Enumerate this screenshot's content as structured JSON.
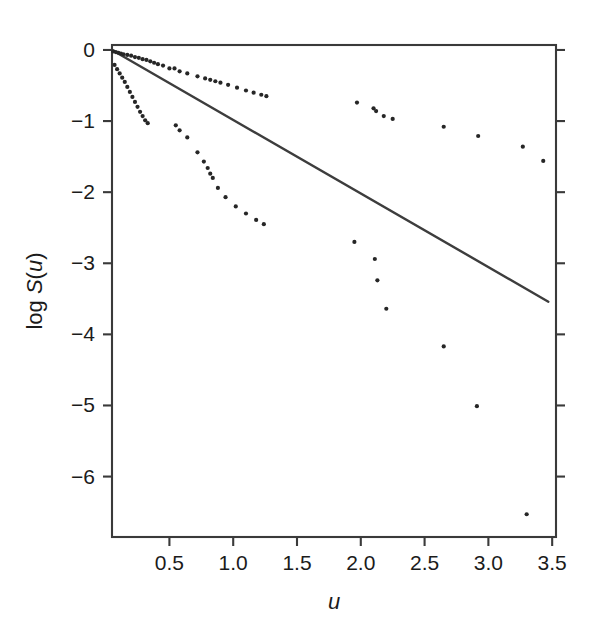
{
  "figure": {
    "name": "log-survival-plot",
    "background_color": "#ffffff",
    "ink_color": "#262626",
    "line_color": "#3d3d3d",
    "frame_color": "#3a3a3a"
  },
  "chart_data": {
    "type": "scatter",
    "title": "",
    "subtitle": "",
    "xlabel": "u",
    "ylabel": "log S(u)",
    "xlabel_parts": [
      {
        "text": "u",
        "italic": true
      }
    ],
    "ylabel_parts": [
      {
        "text": "log ",
        "italic": false
      },
      {
        "text": "S",
        "italic": true
      },
      {
        "text": "(",
        "italic": false
      },
      {
        "text": "u",
        "italic": true
      },
      {
        "text": ")",
        "italic": false
      }
    ],
    "xlim": [
      0.05,
      3.53
    ],
    "ylim": [
      -6.85,
      0.07
    ],
    "xticks": [
      0.5,
      1.0,
      1.5,
      2.0,
      2.5,
      3.0,
      3.5
    ],
    "xticklabels": [
      "0.5",
      "1.0",
      "1.5",
      "2.0",
      "2.5",
      "3.0",
      "3.5"
    ],
    "yticks": [
      0,
      -1,
      -2,
      -3,
      -4,
      -5,
      -6
    ],
    "yticklabels": [
      "0",
      "−1",
      "−2",
      "−3",
      "−4",
      "−5",
      "−6"
    ],
    "grid": false,
    "legend": null,
    "legend_position": "none",
    "frame": "box",
    "tick_direction": "out",
    "marker": "dot",
    "marker_size_px": 3.0,
    "series": [
      {
        "name": "upper-series",
        "description": "points lying above the fitted line, shallow decay",
        "x": [
          0.06,
          0.08,
          0.1,
          0.12,
          0.14,
          0.17,
          0.2,
          0.23,
          0.26,
          0.29,
          0.32,
          0.35,
          0.38,
          0.41,
          0.45,
          0.5,
          0.54,
          0.58,
          0.64,
          0.72,
          0.78,
          0.82,
          0.86,
          0.9,
          0.96,
          1.03,
          1.1,
          1.16,
          1.22,
          1.26
        ],
        "y": [
          -0.02,
          -0.03,
          -0.04,
          -0.05,
          -0.06,
          -0.07,
          -0.08,
          -0.1,
          -0.11,
          -0.13,
          -0.14,
          -0.16,
          -0.18,
          -0.2,
          -0.22,
          -0.26,
          -0.26,
          -0.3,
          -0.33,
          -0.37,
          -0.4,
          -0.42,
          -0.44,
          -0.46,
          -0.49,
          -0.53,
          -0.57,
          -0.6,
          -0.63,
          -0.65
        ]
      },
      {
        "name": "lower-steep-series",
        "description": "left-hand steeply descending arc below the fitted line",
        "x": [
          0.07,
          0.09,
          0.11,
          0.13,
          0.15,
          0.17,
          0.19,
          0.21,
          0.23,
          0.25,
          0.27,
          0.29,
          0.31,
          0.33
        ],
        "y": [
          -0.21,
          -0.27,
          -0.33,
          -0.39,
          -0.45,
          -0.52,
          -0.59,
          -0.66,
          -0.73,
          -0.8,
          -0.87,
          -0.93,
          -0.99,
          -1.03
        ]
      },
      {
        "name": "mid-descending-series",
        "description": "mid-range points descending steeply from about u=0.55 to u=1.25",
        "x": [
          0.55,
          0.58,
          0.64,
          0.72,
          0.77,
          0.8,
          0.82,
          0.84,
          0.88,
          0.94,
          1.02,
          1.1,
          1.18,
          1.24
        ],
        "y": [
          -1.06,
          -1.13,
          -1.23,
          -1.44,
          -1.57,
          -1.66,
          -1.74,
          -1.8,
          -1.94,
          -2.07,
          -2.2,
          -2.3,
          -2.39,
          -2.45
        ]
      },
      {
        "name": "right-upper-scatter",
        "description": "sparse points in the upper-right region above the line",
        "x": [
          1.97,
          2.1,
          2.12,
          2.18,
          2.25,
          2.65,
          2.92,
          3.27,
          3.43
        ],
        "y": [
          -0.74,
          -0.82,
          -0.86,
          -0.93,
          -0.97,
          -1.08,
          -1.21,
          -1.36,
          -1.56
        ]
      },
      {
        "name": "right-lower-scatter",
        "description": "sparse points in the lower-right region below the line",
        "x": [
          1.95,
          2.11,
          2.13,
          2.2,
          2.65,
          2.91,
          3.3
        ],
        "y": [
          -2.7,
          -2.94,
          -3.24,
          -3.64,
          -4.17,
          -5.01,
          -6.53
        ]
      }
    ],
    "reference_line": {
      "name": "fitted-exponential-line",
      "description": "straight reference line from the top-left corner to the right edge",
      "x0": 0.05,
      "y0": 0.0,
      "x1": 3.47,
      "y1": -3.54,
      "slope": -1.035,
      "intercept": 0.052
    }
  }
}
